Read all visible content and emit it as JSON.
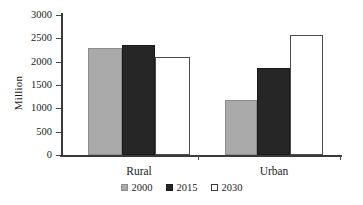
{
  "chart_data": {
    "type": "bar",
    "title": "",
    "xlabel": "",
    "ylabel": "Million",
    "categories": [
      "Rural",
      "Urban"
    ],
    "series": [
      {
        "name": "2000",
        "color": "#aaaaaa",
        "values": [
          2300,
          1170
        ]
      },
      {
        "name": "2015",
        "color": "#262626",
        "values": [
          2360,
          1860
        ]
      },
      {
        "name": "2030",
        "color": "#ffffff",
        "values": [
          2100,
          2570
        ]
      }
    ],
    "ylim": [
      0,
      3000
    ],
    "ytick_step": 500,
    "yticks": [
      "3000",
      "2500",
      "2000",
      "1500",
      "1000",
      "500",
      "0"
    ],
    "grid": false,
    "legend_position": "bottom"
  },
  "legend": {
    "items": [
      {
        "label": "2000"
      },
      {
        "label": "2015"
      },
      {
        "label": "2030"
      }
    ]
  }
}
